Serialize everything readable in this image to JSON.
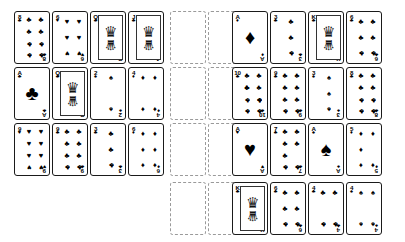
{
  "app": {
    "title": "Solitaire Card Tableau",
    "background_color": "#ffffff",
    "card_border_color": "#1a1a1a",
    "empty_slot_border_color": "#9a9a9a"
  },
  "layout": {
    "columns": 10,
    "rows": 4,
    "card_width": 36,
    "card_height": 53
  },
  "suit_glyphs": {
    "clubs": "♣",
    "hearts": "♥",
    "spades": "♠",
    "diamonds": "♦"
  },
  "grid": [
    [
      {
        "kind": "card",
        "rank": "8",
        "suit": "clubs",
        "pips": 8
      },
      {
        "kind": "card",
        "rank": "6",
        "suit": "hearts",
        "pips": 6
      },
      {
        "kind": "card",
        "rank": "Q",
        "suit": "clubs",
        "court": true
      },
      {
        "kind": "card",
        "rank": "J",
        "suit": "clubs",
        "court": true
      },
      {
        "kind": "empty"
      },
      {
        "kind": "empty"
      },
      {
        "kind": "card",
        "rank": "A",
        "suit": "diamonds",
        "pips": 1
      },
      {
        "kind": "card",
        "rank": "3",
        "suit": "clubs",
        "pips": 3
      },
      {
        "kind": "card",
        "rank": "K",
        "suit": "clubs",
        "court": true
      },
      {
        "kind": "card",
        "rank": "6",
        "suit": "clubs",
        "pips": 6
      }
    ],
    [
      {
        "kind": "card",
        "rank": "A",
        "suit": "clubs",
        "pips": 1
      },
      {
        "kind": "card",
        "rank": "Q",
        "suit": "clubs",
        "court": true
      },
      {
        "kind": "card",
        "rank": "2",
        "suit": "spades",
        "pips": 2
      },
      {
        "kind": "card",
        "rank": "4",
        "suit": "diamonds",
        "pips": 4
      },
      {
        "kind": "empty"
      },
      {
        "kind": "empty"
      },
      {
        "kind": "card",
        "rank": "10",
        "suit": "clubs",
        "pips": 10
      },
      {
        "kind": "card",
        "rank": "9",
        "suit": "clubs",
        "pips": 9
      },
      {
        "kind": "card",
        "rank": "3",
        "suit": "spades",
        "pips": 3
      },
      {
        "kind": "card",
        "rank": "8",
        "suit": "clubs",
        "pips": 8
      }
    ],
    [
      {
        "kind": "card",
        "rank": "9",
        "suit": "hearts",
        "pips": 9
      },
      {
        "kind": "card",
        "rank": "9",
        "suit": "clubs",
        "pips": 9
      },
      {
        "kind": "card",
        "rank": "3",
        "suit": "clubs",
        "pips": 3
      },
      {
        "kind": "card",
        "rank": "6",
        "suit": "diamonds",
        "pips": 6
      },
      {
        "kind": "empty"
      },
      {
        "kind": "empty"
      },
      {
        "kind": "card",
        "rank": "A",
        "suit": "hearts",
        "pips": 1
      },
      {
        "kind": "card",
        "rank": "7",
        "suit": "clubs",
        "pips": 7
      },
      {
        "kind": "card",
        "rank": "A",
        "suit": "spades",
        "pips": 1
      },
      {
        "kind": "card",
        "rank": "5",
        "suit": "diamonds",
        "pips": 5
      }
    ],
    [
      {
        "kind": "blank"
      },
      {
        "kind": "blank"
      },
      {
        "kind": "blank"
      },
      {
        "kind": "blank"
      },
      {
        "kind": "empty"
      },
      {
        "kind": "empty"
      },
      {
        "kind": "card",
        "rank": "K",
        "suit": "clubs",
        "court": true
      },
      {
        "kind": "card",
        "rank": "6",
        "suit": "clubs",
        "pips": 6
      },
      {
        "kind": "card",
        "rank": "4",
        "suit": "clubs",
        "pips": 4
      },
      {
        "kind": "card",
        "rank": "4",
        "suit": "spades",
        "pips": 4
      }
    ]
  ]
}
